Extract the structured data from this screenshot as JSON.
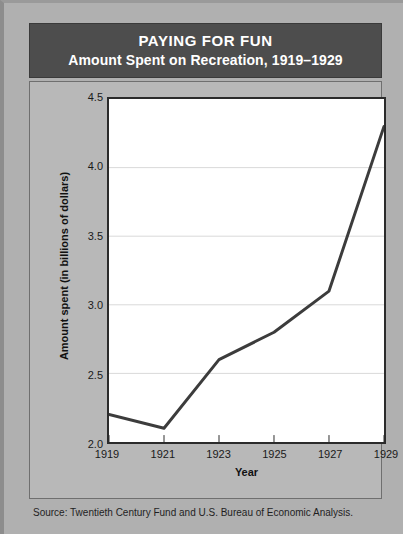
{
  "title": {
    "main": "PAYING FOR FUN",
    "sub": "Amount Spent on Recreation, 1919–1929"
  },
  "source": "Source: Twentieth Century Fund and U.S. Bureau of Economic Analysis.",
  "colors": {
    "background": "#b0b0b0",
    "panel": "#b8b8b8",
    "title_bar": "#4d4d4d",
    "title_text": "#ffffff",
    "plot_background": "#ffffff",
    "plot_border": "#2b2b2b",
    "line": "#3c3c3c",
    "gridline": "#d8d8d8"
  },
  "chart_data": {
    "type": "line",
    "title": "PAYING FOR FUN",
    "subtitle": "Amount Spent on Recreation, 1919–1929",
    "xlabel": "Year",
    "ylabel": "Amount spent (in billions of dollars)",
    "x": [
      1919,
      1921,
      1923,
      1925,
      1927,
      1929
    ],
    "values": [
      2.2,
      2.1,
      2.6,
      2.8,
      3.1,
      4.3
    ],
    "series": [
      {
        "name": "Amount spent on recreation",
        "values": [
          2.2,
          2.1,
          2.6,
          2.8,
          3.1,
          4.3
        ]
      }
    ],
    "xtick_labels": [
      "1919",
      "1921",
      "1923",
      "1925",
      "1927",
      "1929"
    ],
    "ytick_labels": [
      "2.0",
      "2.5",
      "3.0",
      "3.5",
      "4.0",
      "4.5"
    ],
    "yticks": [
      2.0,
      2.5,
      3.0,
      3.5,
      4.0,
      4.5
    ],
    "xlim": [
      1919,
      1929
    ],
    "ylim": [
      2.0,
      4.5
    ],
    "grid": "horizontal",
    "legend": "none",
    "source": "Source: Twentieth Century Fund and U.S. Bureau of Economic Analysis."
  }
}
